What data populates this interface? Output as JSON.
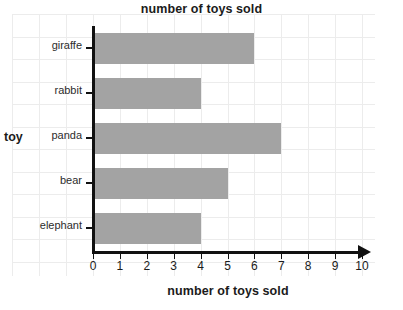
{
  "chart_data": {
    "type": "bar",
    "orientation": "horizontal",
    "title": "number of toys sold",
    "xlabel": "number of toys sold",
    "ylabel": "toy",
    "categories": [
      "giraffe",
      "rabbit",
      "panda",
      "bear",
      "elephant"
    ],
    "values": [
      6,
      4,
      7,
      5,
      4
    ],
    "xlim": [
      0,
      10
    ],
    "xticks": [
      0,
      1,
      2,
      3,
      4,
      5,
      6,
      7,
      8,
      9,
      10
    ],
    "xtick_labels": [
      "0",
      "1",
      "2",
      "3",
      "4",
      "5",
      "6",
      "7",
      "8",
      "9",
      "10"
    ],
    "grid": true,
    "legend": false,
    "bar_color": "#a3a3a3",
    "grid_color": "#ececec",
    "axis_color": "#111111",
    "background_color": "#ffffff"
  }
}
